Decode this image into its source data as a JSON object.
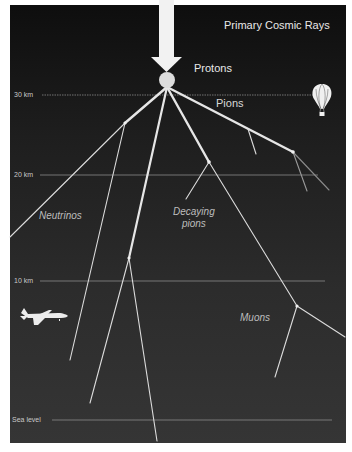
{
  "title": "Primary Cosmic Rays",
  "labels": {
    "protons": "Protons",
    "pions": "Pions",
    "neutrinos": "Neutrinos",
    "decaying_line1": "Decaying",
    "decaying_line2": "pions",
    "muons": "Muons"
  },
  "altitudes": {
    "km30": "30 km",
    "km20": "20 km",
    "km10": "10 km",
    "sea": "Sea level"
  },
  "icons": {
    "arrow": "down-arrow",
    "proton": "circle",
    "balloon": "hot-air-balloon",
    "airplane": "airplane"
  },
  "colors": {
    "background_top": "#0e0e0e",
    "background_bottom": "#353535",
    "ray": "#e6e6e6",
    "altitude_line": "#8a8a8a"
  }
}
